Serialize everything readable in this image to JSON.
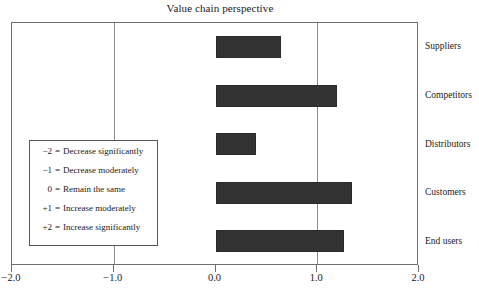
{
  "chart_data": {
    "type": "bar",
    "orientation": "horizontal",
    "title": "Value chain perspective",
    "xlabel": "",
    "ylabel": "",
    "categories": [
      "Suppliers",
      "Competitors",
      "Distributors",
      "Customers",
      "End users"
    ],
    "values": [
      0.64,
      1.19,
      0.4,
      1.34,
      1.26
    ],
    "xlim": [
      -2.0,
      2.0
    ],
    "xticks": [
      -2.0,
      -1.0,
      0.0,
      1.0,
      2.0
    ],
    "xtick_labels": [
      "−2.0",
      "−1.0",
      "0.0",
      "1.0",
      "2.0"
    ],
    "grid": true,
    "gridlines_at": [
      -1.0,
      1.0
    ],
    "legend_position": "inside-left",
    "bar_color": "#333333",
    "frame_color": "#6e6e6e",
    "gridline_color": "#8d8d8d"
  },
  "legend": {
    "entries": [
      {
        "key": "−2",
        "eq": "=",
        "text": "Decrease significantly"
      },
      {
        "key": "−1",
        "eq": "=",
        "text": "Decrease moderately"
      },
      {
        "key": "0",
        "eq": "=",
        "text": "Remain the same"
      },
      {
        "key": "+1",
        "eq": "=",
        "text": "Increase moderately"
      },
      {
        "key": "+2",
        "eq": "=",
        "text": "Increase significantly"
      }
    ]
  }
}
